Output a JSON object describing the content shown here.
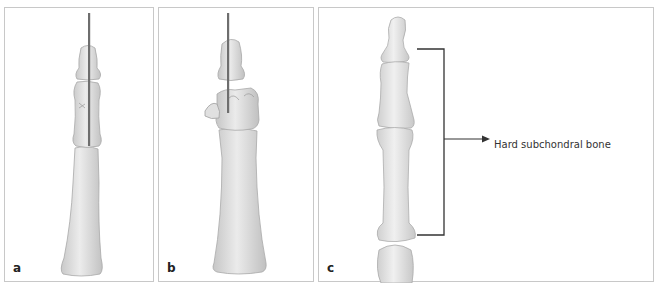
{
  "figure": {
    "panels": [
      {
        "id": "a",
        "label": "a",
        "content": "Finger bones with longitudinal K-wire through distal and middle phalanges"
      },
      {
        "id": "b",
        "label": "b",
        "content": "Finger bones with K-wire and fractured middle phalanx fragments"
      },
      {
        "id": "c",
        "label": "c",
        "content": "Finger bones with bracket indicating region of hard subchondral bone"
      }
    ],
    "annotation": {
      "text": "Hard subchondral bone",
      "arrow": "right-arrow"
    },
    "colors": {
      "bone_fill": "#e6e6e6",
      "bone_shadow": "#c4c4c4",
      "bone_outline": "#a8a8a8",
      "wire": "#6e6e6e",
      "border": "#c8c8c8",
      "bracket": "#333333"
    }
  }
}
